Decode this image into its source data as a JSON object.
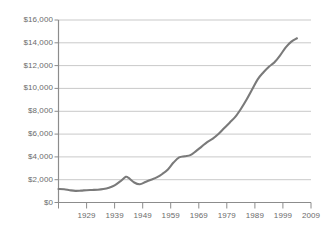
{
  "chart_data": {
    "type": "line",
    "title": "",
    "subtitle": "",
    "xlabel": "",
    "ylabel": "",
    "xlim": [
      1919,
      2009
    ],
    "ylim": [
      0,
      16000
    ],
    "grid": true,
    "gridlines_axis": "y",
    "legend": null,
    "legend_position": "none",
    "y_ticks": [
      0,
      2000,
      4000,
      6000,
      8000,
      10000,
      12000,
      14000,
      16000
    ],
    "y_tick_labels": [
      "$0",
      "$2,000",
      "$4,000",
      "$6,000",
      "$8,000",
      "$10,000",
      "$12,000",
      "$14,000",
      "$16,000"
    ],
    "x_ticks": [
      1919,
      1929,
      1939,
      1949,
      1959,
      1969,
      1979,
      1989,
      1999,
      2009
    ],
    "x_tick_labels": [
      "",
      "1929",
      "1939",
      "1949",
      "1959",
      "1969",
      "1979",
      "1989",
      "1999",
      "2009"
    ],
    "series": [
      {
        "name": "value",
        "color": "#7a7a7a",
        "x": [
          1919,
          1921,
          1923,
          1925,
          1927,
          1929,
          1931,
          1933,
          1935,
          1937,
          1939,
          1941,
          1943,
          1944,
          1946,
          1948,
          1950,
          1952,
          1954,
          1956,
          1958,
          1960,
          1962,
          1964,
          1966,
          1968,
          1970,
          1972,
          1974,
          1976,
          1978,
          1980,
          1982,
          1984,
          1986,
          1988,
          1990,
          1992,
          1994,
          1996,
          1998,
          2000,
          2002,
          2004
        ],
        "y": [
          1180,
          1160,
          1080,
          1020,
          1040,
          1080,
          1100,
          1120,
          1180,
          1300,
          1500,
          1850,
          2250,
          2150,
          1750,
          1600,
          1800,
          2000,
          2200,
          2500,
          2900,
          3500,
          3950,
          4050,
          4150,
          4500,
          4900,
          5300,
          5600,
          6000,
          6500,
          7000,
          7500,
          8200,
          9000,
          9900,
          10800,
          11400,
          11900,
          12300,
          12900,
          13600,
          14100,
          14400
        ]
      }
    ]
  },
  "axis": {
    "line_color": "#8c8c8c",
    "grid_color": "#c9c9c9",
    "tick_color": "#8c8c8c",
    "label_color": "#6b6b6b"
  }
}
